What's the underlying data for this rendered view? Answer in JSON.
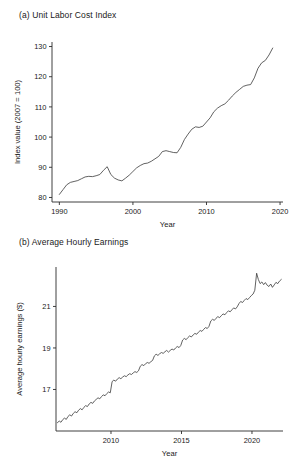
{
  "figure": {
    "background": "#ffffff",
    "line_color": "#3a3a3a",
    "axis_color": "#2b2b2b"
  },
  "panel_a": {
    "letter": "(a)",
    "title": "(a)  Unit Labor Cost Index"
  },
  "panel_b": {
    "letter": "(b)",
    "title": "(b)  Average Hourly Earnings"
  },
  "chart_data": [
    {
      "type": "line",
      "id": "unit-labor-cost-index",
      "title": "(a)  Unit Labor Cost Index",
      "xlabel": "Year",
      "ylabel": "Index value (2007 = 100)",
      "xlim": [
        1989.0,
        2020.4
      ],
      "ylim": [
        78.5,
        131.5
      ],
      "xticks": [
        1990,
        2000,
        2010,
        2020
      ],
      "xticklabels": [
        "1990",
        "2000",
        "2010",
        "2020"
      ],
      "yticks": [
        80,
        90,
        100,
        110,
        120,
        130
      ],
      "yticklabels": [
        "80",
        "90",
        "100",
        "110",
        "120",
        "130"
      ],
      "grid": false,
      "legend": false,
      "x": [
        1990.0,
        1990.5,
        1991.0,
        1991.5,
        1992.0,
        1992.5,
        1993.0,
        1993.5,
        1994.0,
        1994.5,
        1995.0,
        1995.5,
        1996.0,
        1996.5,
        1997.0,
        1997.5,
        1998.0,
        1998.5,
        1999.0,
        1999.5,
        2000.0,
        2000.5,
        2001.0,
        2001.5,
        2002.0,
        2002.5,
        2003.0,
        2003.5,
        2004.0,
        2004.5,
        2005.0,
        2005.5,
        2006.0,
        2006.5,
        2007.0,
        2007.5,
        2008.0,
        2008.5,
        2009.0,
        2009.5,
        2010.0,
        2010.5,
        2011.0,
        2011.5,
        2012.0,
        2012.5,
        2013.0,
        2013.5,
        2014.0,
        2014.5,
        2015.0,
        2015.5,
        2016.0,
        2016.5,
        2017.0,
        2017.5,
        2018.0,
        2018.5,
        2019.0
      ],
      "values": [
        81.0,
        82.6,
        84.2,
        85.0,
        85.3,
        85.6,
        86.2,
        86.8,
        87.0,
        86.9,
        87.2,
        87.6,
        89.0,
        90.2,
        87.6,
        86.4,
        85.8,
        85.5,
        86.4,
        87.4,
        88.6,
        89.8,
        90.6,
        91.2,
        91.4,
        92.0,
        92.8,
        93.6,
        95.2,
        95.5,
        95.2,
        94.9,
        94.8,
        96.6,
        99.2,
        101.0,
        102.6,
        103.4,
        103.2,
        103.6,
        105.0,
        106.4,
        108.4,
        109.6,
        110.4,
        111.0,
        112.2,
        113.6,
        114.8,
        115.8,
        116.8,
        117.2,
        117.4,
        119.6,
        122.8,
        124.6,
        125.4,
        127.2,
        129.5
      ]
    },
    {
      "type": "line",
      "id": "average-hourly-earnings",
      "title": "(b)  Average Hourly Earnings",
      "xlabel": "Year",
      "ylabel": "Average hourly earnings ($)",
      "xlim": [
        2006.1,
        2022.2
      ],
      "ylim": [
        15.0,
        22.9
      ],
      "xticks": [
        2010,
        2015,
        2020
      ],
      "xticklabels": [
        "2010",
        "2015",
        "2020"
      ],
      "yticks": [
        17,
        19,
        21
      ],
      "yticklabels": [
        "17",
        "19",
        "21"
      ],
      "grid": false,
      "legend": false,
      "x": [
        2006.2,
        2006.33,
        2006.45,
        2006.58,
        2006.7,
        2006.83,
        2006.95,
        2007.08,
        2007.2,
        2007.33,
        2007.45,
        2007.58,
        2007.7,
        2007.83,
        2007.95,
        2008.08,
        2008.2,
        2008.33,
        2008.45,
        2008.58,
        2008.7,
        2008.83,
        2008.95,
        2009.08,
        2009.2,
        2009.33,
        2009.45,
        2009.58,
        2009.7,
        2009.83,
        2009.95,
        2010.08,
        2010.2,
        2010.33,
        2010.45,
        2010.58,
        2010.7,
        2010.83,
        2010.95,
        2011.08,
        2011.2,
        2011.33,
        2011.45,
        2011.58,
        2011.7,
        2011.83,
        2011.95,
        2012.08,
        2012.2,
        2012.33,
        2012.45,
        2012.58,
        2012.7,
        2012.83,
        2012.95,
        2013.08,
        2013.2,
        2013.33,
        2013.45,
        2013.58,
        2013.7,
        2013.83,
        2013.95,
        2014.08,
        2014.2,
        2014.33,
        2014.45,
        2014.58,
        2014.7,
        2014.83,
        2014.95,
        2015.08,
        2015.2,
        2015.33,
        2015.45,
        2015.58,
        2015.7,
        2015.83,
        2015.95,
        2016.08,
        2016.2,
        2016.33,
        2016.45,
        2016.58,
        2016.7,
        2016.83,
        2016.95,
        2017.08,
        2017.2,
        2017.33,
        2017.45,
        2017.58,
        2017.7,
        2017.83,
        2017.95,
        2018.08,
        2018.2,
        2018.33,
        2018.45,
        2018.58,
        2018.7,
        2018.83,
        2018.95,
        2019.08,
        2019.2,
        2019.33,
        2019.45,
        2019.58,
        2019.7,
        2019.83,
        2019.95,
        2020.08,
        2020.2,
        2020.33,
        2020.45,
        2020.58,
        2020.7,
        2020.83,
        2020.95,
        2021.08,
        2021.2,
        2021.33,
        2021.45,
        2021.58,
        2021.7,
        2021.83,
        2021.95,
        2022.08
      ],
      "values": [
        15.4,
        15.48,
        15.42,
        15.55,
        15.62,
        15.56,
        15.7,
        15.78,
        15.72,
        15.85,
        15.93,
        15.88,
        16.0,
        16.08,
        16.02,
        16.14,
        16.22,
        16.18,
        16.3,
        16.38,
        16.33,
        16.45,
        16.52,
        16.6,
        16.55,
        16.66,
        16.74,
        16.7,
        16.8,
        16.88,
        16.84,
        17.38,
        17.45,
        17.4,
        17.5,
        17.57,
        17.52,
        17.6,
        17.66,
        17.62,
        17.7,
        17.76,
        17.72,
        17.8,
        17.86,
        17.82,
        17.9,
        18.12,
        18.2,
        18.15,
        18.24,
        18.3,
        18.26,
        18.34,
        18.4,
        18.62,
        18.7,
        18.64,
        18.72,
        18.78,
        18.74,
        18.82,
        18.88,
        18.8,
        18.88,
        18.95,
        18.9,
        19.0,
        19.07,
        19.02,
        19.12,
        19.38,
        19.46,
        19.4,
        19.5,
        19.58,
        19.53,
        19.63,
        19.7,
        19.66,
        19.76,
        19.84,
        19.8,
        19.9,
        19.98,
        19.94,
        20.04,
        20.3,
        20.38,
        20.33,
        20.43,
        20.51,
        20.46,
        20.56,
        20.64,
        20.6,
        20.7,
        20.79,
        20.74,
        20.84,
        20.93,
        20.88,
        20.98,
        21.14,
        21.24,
        21.19,
        21.29,
        21.38,
        21.33,
        21.43,
        21.52,
        21.6,
        21.78,
        22.6,
        22.3,
        22.1,
        22.18,
        22.05,
        22.15,
        22.02,
        21.96,
        22.08,
        21.92,
        22.04,
        22.16,
        22.1,
        22.22,
        22.3
      ]
    }
  ]
}
